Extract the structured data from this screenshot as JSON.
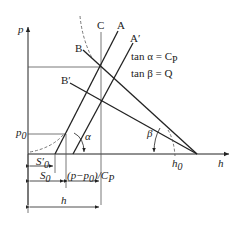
{
  "diagram": {
    "axes": {
      "y_label": "p",
      "x_label": "h"
    },
    "line_labels": {
      "A": "A",
      "A_prime": "A′",
      "B": "B",
      "B_prime": "B′",
      "C": "C"
    },
    "equations": {
      "alpha": "tan α = C",
      "alpha_sub": "P",
      "beta": "tan β = Q"
    },
    "angles": {
      "alpha": "α",
      "beta": "β"
    },
    "points": {
      "p0": "p",
      "p0_sub": "0",
      "h0": "h",
      "h0_sub": "0"
    },
    "dimensions": {
      "s0_prime": "S′",
      "s0_prime_sub": "0",
      "s0": "S",
      "s0_sub": "0",
      "delta": "(p−p",
      "delta_sub": "0",
      "delta_tail": ")/C",
      "delta_tail_sub": "P",
      "h": "h"
    },
    "colors": {
      "line": "#222222",
      "guide": "#555555"
    }
  }
}
